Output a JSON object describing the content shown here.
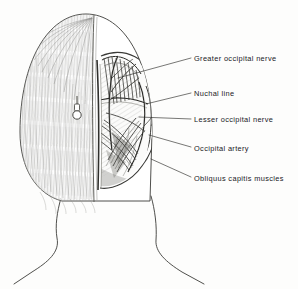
{
  "figure": {
    "kind": "anatomical-illustration",
    "orientation": "posterior",
    "ink_color": "#2b2b29",
    "hair_color": "#8d8d8a",
    "background_color": "#fdfdfc",
    "halves": {
      "left": "hair-shaded intact scalp",
      "right": "dissected suboccipital region"
    }
  },
  "labels": [
    {
      "id": "greater-occipital-nerve",
      "text": "Greater occipital nerve",
      "x": 194,
      "y": 55,
      "leader": {
        "x1": 190,
        "y1": 59,
        "x2": 118,
        "y2": 78
      }
    },
    {
      "id": "nuchal-line",
      "text": "Nuchal  line",
      "x": 194,
      "y": 90,
      "leader": {
        "x1": 190,
        "y1": 94,
        "x2": 146,
        "y2": 104
      }
    },
    {
      "id": "lesser-occipital-nerve",
      "text": "Lesser  occipital nerve",
      "x": 194,
      "y": 116,
      "leader": {
        "x1": 190,
        "y1": 120,
        "x2": 140,
        "y2": 118
      }
    },
    {
      "id": "occipital-artery",
      "text": "Occipital  artery",
      "x": 194,
      "y": 145,
      "leader": {
        "x1": 190,
        "y1": 148,
        "x2": 150,
        "y2": 136
      }
    },
    {
      "id": "obliquus-capitis-muscles",
      "text": "Obliquus capitis muscles",
      "x": 194,
      "y": 175,
      "leader": {
        "x1": 190,
        "y1": 178,
        "x2": 152,
        "y2": 160
      }
    }
  ],
  "marker": {
    "id": "pin-marker",
    "description": "small pin / probe marker on left scalp",
    "x": 77,
    "y": 104
  }
}
